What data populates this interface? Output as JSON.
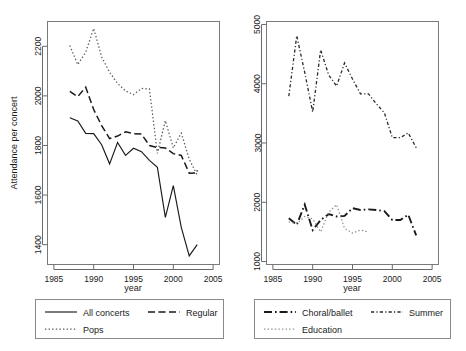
{
  "figure": {
    "title": "",
    "panels": 2
  },
  "chart_data": [
    {
      "type": "line",
      "panel": "left",
      "title": "",
      "xlabel": "year",
      "ylabel": "Attendance per concert",
      "xlim": [
        1984.2,
        2005.8
      ],
      "ylim": [
        1320,
        2300
      ],
      "xticks": [
        1985,
        1990,
        1995,
        2000,
        2005
      ],
      "yticks": [
        1400,
        1600,
        1800,
        2000,
        2200
      ],
      "grid": false,
      "legend_position": "below",
      "x": [
        1987,
        1988,
        1989,
        1990,
        1991,
        1992,
        1993,
        1994,
        1995,
        1996,
        1997,
        1998,
        1999,
        2000,
        2001,
        2002,
        2003
      ],
      "series": [
        {
          "name": "All concerts",
          "style": "solid",
          "color": "#1a1a1a",
          "values": [
            1912,
            1899,
            1849,
            1848,
            1803,
            1726,
            1812,
            1760,
            1789,
            1775,
            1740,
            1712,
            1510,
            1638,
            1470,
            1355,
            1400
          ]
        },
        {
          "name": "Regular",
          "style": "dashed",
          "color": "#1a1a1a",
          "values": [
            2018,
            1997,
            2035,
            1945,
            1880,
            1828,
            1838,
            1855,
            1848,
            1846,
            1800,
            1792,
            1790,
            1767,
            1760,
            1688,
            1690,
            1700
          ]
        },
        {
          "name": "Pops",
          "style": "dotted",
          "color": "#5a5a5a",
          "values": [
            2203,
            2126,
            2176,
            2272,
            2157,
            2095,
            2050,
            2020,
            2005,
            2030,
            2028,
            1768,
            1900,
            1790,
            1850,
            1745,
            1680
          ]
        }
      ]
    },
    {
      "type": "line",
      "panel": "right",
      "title": "",
      "xlabel": "year",
      "ylabel": "",
      "xlim": [
        1984.2,
        2005.8
      ],
      "ylim": [
        950,
        5050
      ],
      "xticks": [
        1985,
        1990,
        1995,
        2000,
        2005
      ],
      "yticks": [
        1000,
        2000,
        3000,
        4000,
        5000
      ],
      "grid": false,
      "legend_position": "below",
      "x": [
        1987,
        1988,
        1989,
        1990,
        1991,
        1992,
        1993,
        1994,
        1995,
        1996,
        1997,
        1998,
        1999,
        2000,
        2001,
        2002,
        2003
      ],
      "series": [
        {
          "name": "Choral/ballet",
          "style": "dashdot",
          "color": "#1a1a1a",
          "values": [
            1730,
            1620,
            1960,
            1530,
            1700,
            1800,
            1760,
            1770,
            1900,
            1870,
            1880,
            1870,
            1850,
            1700,
            1700,
            1790,
            1440
          ]
        },
        {
          "name": "Summer",
          "style": "dashdotdot",
          "color": "#2a2a2a",
          "values": [
            3790,
            4810,
            4190,
            3520,
            4570,
            4150,
            3960,
            4350,
            4080,
            3830,
            3830,
            3660,
            3510,
            3090,
            3090,
            3170,
            2920
          ]
        },
        {
          "name": "Education",
          "style": "dotted",
          "color": "#8f8f8f",
          "values": [
            1670,
            1640,
            1760,
            1720,
            1500,
            1830,
            1960,
            1560,
            1480,
            1530,
            1500
          ]
        }
      ]
    }
  ],
  "left_panel": {
    "y_axis": {
      "label": "Attendance per concert",
      "ticks": [
        "1400",
        "1600",
        "1800",
        "2000",
        "2200"
      ]
    },
    "x_axis": {
      "label": "year",
      "ticks": [
        "1985",
        "1990",
        "1995",
        "2000",
        "2005"
      ]
    },
    "legend": {
      "items": [
        {
          "label": "All concerts",
          "style": "solid"
        },
        {
          "label": "Regular",
          "style": "dashed"
        },
        {
          "label": "Pops",
          "style": "dotted"
        }
      ]
    }
  },
  "right_panel": {
    "y_axis": {
      "label": "",
      "ticks": [
        "1000",
        "2000",
        "3000",
        "4000",
        "5000"
      ]
    },
    "x_axis": {
      "label": "year",
      "ticks": [
        "1985",
        "1990",
        "1995",
        "2000",
        "2005"
      ]
    },
    "legend": {
      "items": [
        {
          "label": "Choral/ballet",
          "style": "dashdot"
        },
        {
          "label": "Summer",
          "style": "dashdotdot"
        },
        {
          "label": "Education",
          "style": "dotted"
        }
      ]
    }
  }
}
